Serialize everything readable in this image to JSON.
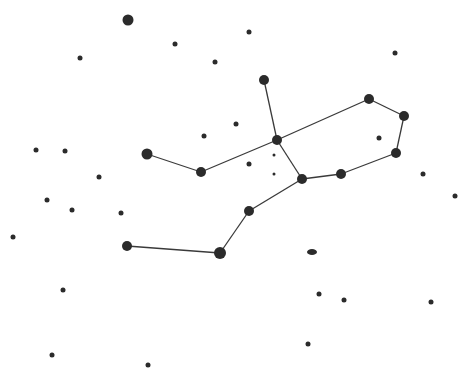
{
  "diagram": {
    "type": "constellation-star-map",
    "background": "#ffffff",
    "star_color": "#2b2b2b",
    "line_color": "#3a3a3a",
    "constellation_stars": [
      {
        "id": "a",
        "x": 264,
        "y": 80,
        "r": 5
      },
      {
        "id": "b",
        "x": 277,
        "y": 140,
        "r": 5
      },
      {
        "id": "c",
        "x": 369,
        "y": 99,
        "r": 5
      },
      {
        "id": "d",
        "x": 404,
        "y": 116,
        "r": 5
      },
      {
        "id": "e",
        "x": 396,
        "y": 153,
        "r": 5
      },
      {
        "id": "f",
        "x": 341,
        "y": 174,
        "r": 5
      },
      {
        "id": "g",
        "x": 302,
        "y": 179,
        "r": 5
      },
      {
        "id": "h",
        "x": 249,
        "y": 211,
        "r": 5
      },
      {
        "id": "i",
        "x": 220,
        "y": 253,
        "r": 6
      },
      {
        "id": "j",
        "x": 127,
        "y": 246,
        "r": 5
      },
      {
        "id": "k",
        "x": 147,
        "y": 154,
        "r": 5.5
      },
      {
        "id": "l",
        "x": 201,
        "y": 172,
        "r": 5
      }
    ],
    "edges": [
      [
        "a",
        "b"
      ],
      [
        "b",
        "c"
      ],
      [
        "c",
        "d"
      ],
      [
        "d",
        "e"
      ],
      [
        "e",
        "f"
      ],
      [
        "f",
        "g"
      ],
      [
        "g",
        "b"
      ],
      [
        "g",
        "h"
      ],
      [
        "h",
        "i"
      ],
      [
        "i",
        "j"
      ],
      [
        "b",
        "l"
      ],
      [
        "l",
        "k"
      ]
    ],
    "background_stars": [
      {
        "x": 128,
        "y": 20,
        "r": 5.5
      },
      {
        "x": 175,
        "y": 44,
        "r": 2.5
      },
      {
        "x": 249,
        "y": 32,
        "r": 2.5
      },
      {
        "x": 80,
        "y": 58,
        "r": 2.5
      },
      {
        "x": 215,
        "y": 62,
        "r": 2.5
      },
      {
        "x": 395,
        "y": 53,
        "r": 2.5
      },
      {
        "x": 236,
        "y": 124,
        "r": 2.5
      },
      {
        "x": 204,
        "y": 136,
        "r": 2.5
      },
      {
        "x": 379,
        "y": 138,
        "r": 2.5
      },
      {
        "x": 36,
        "y": 150,
        "r": 2.5
      },
      {
        "x": 65,
        "y": 151,
        "r": 2.5
      },
      {
        "x": 274,
        "y": 155,
        "r": 1.5
      },
      {
        "x": 249,
        "y": 164,
        "r": 2.5
      },
      {
        "x": 274,
        "y": 174,
        "r": 1.5
      },
      {
        "x": 99,
        "y": 177,
        "r": 2.5
      },
      {
        "x": 423,
        "y": 174,
        "r": 2.5
      },
      {
        "x": 47,
        "y": 200,
        "r": 2.5
      },
      {
        "x": 72,
        "y": 210,
        "r": 2.5
      },
      {
        "x": 121,
        "y": 213,
        "r": 2.5
      },
      {
        "x": 455,
        "y": 196,
        "r": 2.5
      },
      {
        "x": 13,
        "y": 237,
        "r": 2.5
      },
      {
        "x": 63,
        "y": 290,
        "r": 2.5
      },
      {
        "x": 319,
        "y": 294,
        "r": 2.5
      },
      {
        "x": 344,
        "y": 300,
        "r": 2.5
      },
      {
        "x": 431,
        "y": 302,
        "r": 2.5
      },
      {
        "x": 308,
        "y": 344,
        "r": 2.5
      },
      {
        "x": 52,
        "y": 355,
        "r": 2.5
      },
      {
        "x": 148,
        "y": 365,
        "r": 2.5
      }
    ],
    "nebula": {
      "cx": 312,
      "cy": 252,
      "rx": 5,
      "ry": 3
    }
  }
}
